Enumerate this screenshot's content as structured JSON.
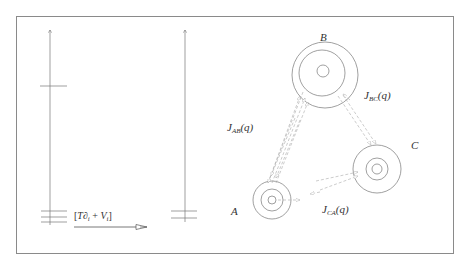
{
  "figure": {
    "frame": {
      "x": 16,
      "y": 16,
      "width": 437,
      "height": 237
    },
    "colors": {
      "frame": "#8a8a8a",
      "lines": "#666666",
      "circles": "#777777",
      "arrows": "#aaaaaa",
      "text": "#333333"
    }
  },
  "left_panel": {
    "axes": [
      {
        "name": "left-energy-axis",
        "x": 50,
        "y_top": 29,
        "y_bottom": 225,
        "levels": [
          {
            "y": 86,
            "x1": 40,
            "x2": 67
          },
          {
            "y": 211,
            "x1": 41,
            "x2": 67
          },
          {
            "y": 217,
            "x1": 41,
            "x2": 67
          },
          {
            "y": 222,
            "x1": 41,
            "x2": 67
          }
        ]
      },
      {
        "name": "right-energy-axis",
        "x": 185,
        "y_top": 29,
        "y_bottom": 222,
        "levels": [
          {
            "y": 211,
            "x1": 171,
            "x2": 197
          },
          {
            "y": 218,
            "x1": 171,
            "x2": 197
          }
        ]
      }
    ],
    "operator_label": {
      "open": "[",
      "T": "T",
      "partial": "∂",
      "sub_i": "i",
      "plus": " + ",
      "V": "V",
      "sub_i2": "i",
      "close": "]"
    },
    "transition_arrow": {
      "x1": 74,
      "x2": 148,
      "y": 227
    }
  },
  "right_panel": {
    "nodes": [
      {
        "id": "A",
        "label": "A",
        "cx": 272,
        "cy": 200,
        "radii": [
          19,
          11,
          4
        ],
        "label_x": 231,
        "label_y": 206
      },
      {
        "id": "B",
        "label": "B",
        "cx": 324,
        "cy": 74,
        "radii": [
          33,
          23,
          6
        ],
        "label_x": 320,
        "label_y": 32
      },
      {
        "id": "C",
        "label": "C",
        "cx": 377,
        "cy": 169,
        "radii": [
          24,
          11,
          5
        ],
        "label_x": 411,
        "label_y": 140
      }
    ],
    "couplings": [
      {
        "id": "AB",
        "J": "J",
        "sub": "AB",
        "arg": "(q)",
        "x": 227,
        "y": 122
      },
      {
        "id": "BC",
        "J": "J",
        "sub": "BC",
        "arg": "(q)",
        "x": 364,
        "y": 90
      },
      {
        "id": "CA",
        "J": "J",
        "sub": "CA",
        "arg": "(q)",
        "x": 322,
        "y": 204
      }
    ]
  }
}
